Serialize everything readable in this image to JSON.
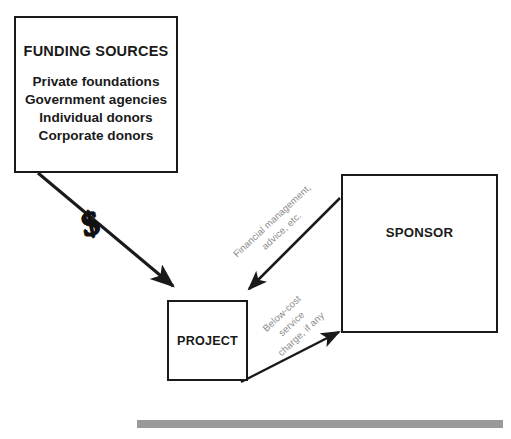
{
  "diagram": {
    "nodes": {
      "funding": {
        "title": "FUNDING SOURCES",
        "items": [
          "Private foundations",
          "Government agencies",
          "Individual donors",
          "Corporate donors"
        ]
      },
      "project": {
        "label": "PROJECT"
      },
      "sponsor": {
        "label": "SPONSOR"
      }
    },
    "edges": {
      "money": {
        "symbol": "$",
        "from": "funding",
        "to": "project",
        "label": ""
      },
      "services": {
        "from": "sponsor",
        "to": "project",
        "line1": "Financial management,",
        "line2": "advice, etc."
      },
      "charge": {
        "from": "project",
        "to": "sponsor",
        "line1": "Below-cost",
        "line2": "service",
        "line3": "charge, if any"
      }
    },
    "colors": {
      "stroke": "#1a1a1a",
      "label_text": "#8c8c8c",
      "bar": "#9a9a9a",
      "background": "#ffffff"
    }
  }
}
